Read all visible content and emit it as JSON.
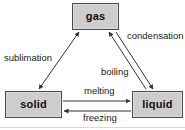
{
  "diagram": {
    "type": "state-transition-diagram",
    "background_color": "#ffffff",
    "node_fill_color": "#cdcdcd",
    "node_border_color": "#4a4a4a",
    "edge_color": "#333333",
    "nodes": [
      {
        "id": "gas",
        "label": "gas",
        "x": 72,
        "y": 3,
        "width": 47,
        "height": 27
      },
      {
        "id": "solid",
        "label": "solid",
        "x": 5,
        "y": 91,
        "width": 57,
        "height": 27
      },
      {
        "id": "liquid",
        "label": "liquid",
        "x": 132,
        "y": 91,
        "width": 51,
        "height": 27
      }
    ],
    "edges": [
      {
        "id": "sublimation",
        "label": "sublimation",
        "from": "solid",
        "to": "gas",
        "direction": "bidirectional",
        "label_x": 4,
        "label_y": 53
      },
      {
        "id": "condensation",
        "label": "condensation",
        "from": "gas",
        "to": "liquid",
        "direction": "gas-to-liquid",
        "label_x": 127,
        "label_y": 31
      },
      {
        "id": "boiling",
        "label": "boiling",
        "from": "liquid",
        "to": "gas",
        "direction": "liquid-to-gas",
        "label_x": 101,
        "label_y": 67
      },
      {
        "id": "melting",
        "label": "melting",
        "from": "solid",
        "to": "liquid",
        "direction": "solid-to-liquid",
        "label_x": 84,
        "label_y": 86
      },
      {
        "id": "freezing",
        "label": "freezing",
        "from": "liquid",
        "to": "solid",
        "direction": "liquid-to-solid",
        "label_x": 83,
        "label_y": 113
      }
    ]
  }
}
